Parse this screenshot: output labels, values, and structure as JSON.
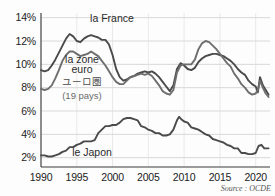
{
  "chart_data": {
    "type": "line",
    "title": "",
    "xlabel": "",
    "ylabel": "",
    "grid": true,
    "legend_position": "inline-annotations",
    "xlim": [
      1990,
      2022
    ],
    "ylim": [
      1.2,
      14.4
    ],
    "yticks": [
      2,
      4,
      6,
      8,
      10,
      12,
      14
    ],
    "ytick_labels": [
      "2%",
      "4%",
      "6%",
      "8%",
      "10%",
      "12%",
      "14%"
    ],
    "xticks": [
      1990,
      1995,
      2000,
      2005,
      2010,
      2015,
      2020
    ],
    "xtick_labels": [
      "1990",
      "1995",
      "2000",
      "2005",
      "2010",
      "2015",
      "2020"
    ],
    "source": "Source : OCDE",
    "series": [
      {
        "name": "la France",
        "label": "la France",
        "color": "#4a4a4a",
        "x": [
          1990.0,
          1990.5,
          1991.0,
          1991.5,
          1992.0,
          1992.5,
          1993.0,
          1993.5,
          1994.0,
          1994.5,
          1995.0,
          1995.5,
          1996.0,
          1996.5,
          1997.0,
          1997.5,
          1998.0,
          1998.5,
          1999.0,
          1999.5,
          2000.0,
          2000.5,
          2001.0,
          2001.5,
          2002.0,
          2002.5,
          2003.0,
          2003.5,
          2004.0,
          2004.5,
          2005.0,
          2005.5,
          2006.0,
          2006.5,
          2007.0,
          2007.5,
          2008.0,
          2008.5,
          2009.0,
          2009.5,
          2010.0,
          2010.5,
          2011.0,
          2011.5,
          2012.0,
          2012.5,
          2013.0,
          2013.5,
          2014.0,
          2014.5,
          2015.0,
          2015.5,
          2016.0,
          2016.5,
          2017.0,
          2017.5,
          2018.0,
          2018.5,
          2019.0,
          2019.5,
          2020.0,
          2020.3,
          2020.6,
          2021.0,
          2021.4,
          2021.8
        ],
        "values": [
          9.5,
          9.4,
          9.5,
          9.9,
          10.4,
          11.0,
          11.6,
          12.2,
          12.6,
          12.4,
          12.0,
          11.9,
          12.2,
          12.4,
          12.5,
          12.4,
          12.3,
          12.1,
          12.1,
          11.7,
          10.8,
          9.6,
          8.9,
          8.6,
          8.7,
          8.9,
          9.0,
          9.2,
          9.3,
          9.4,
          9.3,
          9.4,
          9.2,
          8.9,
          8.5,
          8.1,
          7.7,
          8.2,
          9.6,
          10.1,
          9.9,
          9.6,
          9.5,
          9.7,
          10.2,
          10.5,
          10.7,
          10.8,
          10.9,
          10.9,
          10.8,
          10.7,
          10.5,
          10.3,
          10.0,
          9.6,
          9.3,
          9.1,
          8.6,
          8.3,
          8.1,
          7.6,
          8.9,
          8.2,
          7.8,
          7.4
        ]
      },
      {
        "name": "la zone euro",
        "label": "la zone euro",
        "label_jp": "ユーロ圏",
        "label_sub": "(19 pays)",
        "color": "#6e6e6e",
        "x": [
          1990.0,
          1990.5,
          1991.0,
          1991.5,
          1992.0,
          1992.5,
          1993.0,
          1993.5,
          1994.0,
          1994.5,
          1995.0,
          1995.5,
          1996.0,
          1996.5,
          1997.0,
          1997.5,
          1998.0,
          1998.5,
          1999.0,
          1999.5,
          2000.0,
          2000.5,
          2001.0,
          2001.5,
          2002.0,
          2002.5,
          2003.0,
          2003.5,
          2004.0,
          2004.5,
          2005.0,
          2005.5,
          2006.0,
          2006.5,
          2007.0,
          2007.5,
          2008.0,
          2008.5,
          2009.0,
          2009.5,
          2010.0,
          2010.5,
          2011.0,
          2011.5,
          2012.0,
          2012.5,
          2013.0,
          2013.5,
          2014.0,
          2014.5,
          2015.0,
          2015.5,
          2016.0,
          2016.5,
          2017.0,
          2017.5,
          2018.0,
          2018.5,
          2019.0,
          2019.5,
          2020.0,
          2020.3,
          2020.6,
          2021.0,
          2021.4,
          2021.8
        ],
        "values": [
          7.9,
          7.8,
          7.9,
          8.2,
          8.8,
          9.5,
          10.3,
          10.8,
          11.1,
          11.1,
          10.9,
          10.7,
          10.8,
          10.9,
          11.1,
          10.9,
          10.7,
          10.3,
          9.9,
          9.4,
          8.9,
          8.5,
          8.3,
          8.3,
          8.6,
          8.9,
          9.0,
          9.1,
          9.2,
          9.1,
          9.2,
          9.0,
          8.6,
          8.2,
          7.7,
          7.5,
          7.4,
          7.8,
          9.3,
          9.9,
          10.0,
          10.0,
          10.0,
          10.4,
          11.3,
          11.8,
          12.0,
          11.9,
          11.6,
          11.3,
          10.9,
          10.5,
          10.1,
          9.8,
          9.2,
          8.8,
          8.3,
          8.0,
          7.6,
          7.4,
          7.5,
          7.8,
          8.6,
          8.0,
          7.5,
          7.2
        ]
      },
      {
        "name": "le Japon",
        "label": "le Japon",
        "color": "#4a4a4a",
        "x": [
          1990.0,
          1990.5,
          1991.0,
          1991.5,
          1992.0,
          1992.5,
          1993.0,
          1993.5,
          1994.0,
          1994.5,
          1995.0,
          1995.5,
          1996.0,
          1996.5,
          1997.0,
          1997.5,
          1998.0,
          1998.5,
          1999.0,
          1999.5,
          2000.0,
          2000.5,
          2001.0,
          2001.5,
          2002.0,
          2002.5,
          2003.0,
          2003.5,
          2004.0,
          2004.5,
          2005.0,
          2005.5,
          2006.0,
          2006.5,
          2007.0,
          2007.5,
          2008.0,
          2008.5,
          2009.0,
          2009.3,
          2009.6,
          2010.0,
          2010.5,
          2011.0,
          2011.5,
          2012.0,
          2012.5,
          2013.0,
          2013.5,
          2014.0,
          2014.5,
          2015.0,
          2015.5,
          2016.0,
          2016.5,
          2017.0,
          2017.5,
          2018.0,
          2018.5,
          2019.0,
          2019.5,
          2020.0,
          2020.4,
          2020.8,
          2021.2,
          2021.8
        ],
        "values": [
          2.2,
          2.2,
          2.1,
          2.1,
          2.2,
          2.3,
          2.5,
          2.6,
          2.9,
          2.9,
          3.1,
          3.2,
          3.4,
          3.4,
          3.4,
          3.5,
          4.1,
          4.4,
          4.7,
          4.7,
          4.8,
          4.8,
          5.0,
          5.3,
          5.4,
          5.4,
          5.3,
          5.2,
          4.7,
          4.6,
          4.4,
          4.3,
          4.1,
          4.1,
          3.9,
          3.9,
          4.0,
          4.4,
          5.2,
          5.5,
          5.3,
          5.1,
          5.0,
          4.6,
          4.5,
          4.4,
          4.2,
          4.0,
          3.9,
          3.6,
          3.5,
          3.4,
          3.3,
          3.1,
          3.0,
          2.8,
          2.8,
          2.4,
          2.4,
          2.3,
          2.3,
          2.4,
          3.0,
          3.1,
          2.8,
          2.8
        ]
      }
    ]
  },
  "axis": {
    "ytick_labels": [
      "14%",
      "12%",
      "10%",
      "8%",
      "6%",
      "4%",
      "2%"
    ],
    "xtick_labels": [
      "1990",
      "1995",
      "2000",
      "2005",
      "2010",
      "2015",
      "2020"
    ]
  },
  "annotations": {
    "france": "la France",
    "eurozone_line1": "la zone",
    "eurozone_line2": "euro",
    "eurozone_jp": "ユーロ圏",
    "eurozone_sub": "(19 pays)",
    "japan": "le Japon"
  },
  "footer": {
    "source": "Source : OCDE"
  },
  "colors": {
    "france_line": "#4a4a4a",
    "eurozone_line": "#6e6e6e",
    "japan_line": "#4a4a4a",
    "grid": "#c9c9c9",
    "axis": "#3a3a3a",
    "background": "#fdfdfd"
  }
}
